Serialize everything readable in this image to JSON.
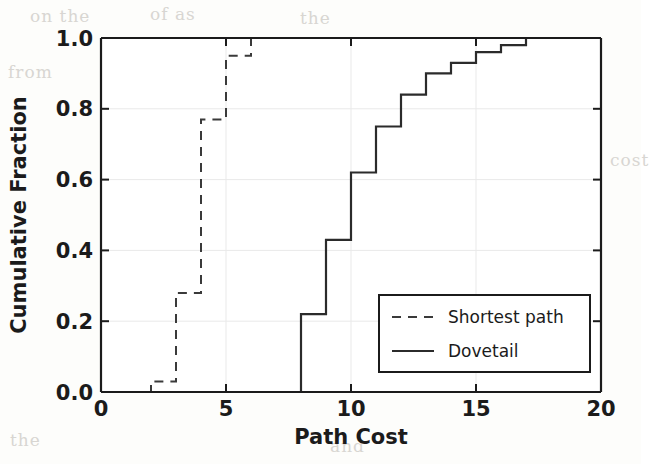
{
  "chart_data": {
    "type": "line",
    "subtype": "step-cdf",
    "title": "",
    "xlabel": "Path Cost",
    "ylabel": "Cumulative Fraction",
    "xlim": [
      0,
      20
    ],
    "ylim": [
      0.0,
      1.0
    ],
    "xticks": [
      0,
      5,
      10,
      15,
      20
    ],
    "xtick_labels": [
      "0",
      "5",
      "10",
      "15",
      "20"
    ],
    "yticks": [
      0.0,
      0.2,
      0.4,
      0.6,
      0.8,
      1.0
    ],
    "ytick_labels": [
      "0.0",
      "0.2",
      "0.4",
      "0.6",
      "0.8",
      "1.0"
    ],
    "grid": true,
    "grid_color": "#e8e8e8",
    "legend_position": "lower right",
    "line_color": "#2b2b2b",
    "series": [
      {
        "name": "Shortest path",
        "style": "dashed",
        "x": [
          0,
          2,
          2,
          3,
          3,
          4,
          4,
          5,
          5,
          6,
          6,
          20
        ],
        "y": [
          0.0,
          0.0,
          0.03,
          0.03,
          0.28,
          0.28,
          0.77,
          0.77,
          0.95,
          0.95,
          1.0,
          1.0
        ],
        "steps": [
          {
            "x": 2,
            "y": 0.03
          },
          {
            "x": 3,
            "y": 0.28
          },
          {
            "x": 4,
            "y": 0.77
          },
          {
            "x": 5,
            "y": 0.95
          },
          {
            "x": 6,
            "y": 1.0
          }
        ]
      },
      {
        "name": "Dovetail",
        "style": "solid",
        "x": [
          0,
          8,
          8,
          9,
          9,
          10,
          10,
          11,
          11,
          12,
          12,
          13,
          13,
          14,
          14,
          15,
          15,
          16,
          16,
          17,
          17,
          20
        ],
        "y": [
          0.0,
          0.0,
          0.22,
          0.22,
          0.43,
          0.43,
          0.62,
          0.62,
          0.75,
          0.75,
          0.84,
          0.84,
          0.9,
          0.9,
          0.93,
          0.93,
          0.96,
          0.96,
          0.98,
          0.98,
          1.0,
          1.0
        ],
        "steps": [
          {
            "x": 8,
            "y": 0.22
          },
          {
            "x": 9,
            "y": 0.43
          },
          {
            "x": 10,
            "y": 0.62
          },
          {
            "x": 11,
            "y": 0.75
          },
          {
            "x": 12,
            "y": 0.84
          },
          {
            "x": 13,
            "y": 0.9
          },
          {
            "x": 14,
            "y": 0.93
          },
          {
            "x": 15,
            "y": 0.96
          },
          {
            "x": 16,
            "y": 0.98
          },
          {
            "x": 17,
            "y": 1.0
          }
        ]
      }
    ]
  },
  "axes": {
    "xlabel": "Path Cost",
    "ylabel": "Cumulative Fraction",
    "xtick_0": "0",
    "xtick_1": "5",
    "xtick_2": "10",
    "xtick_3": "15",
    "xtick_4": "20",
    "ytick_0": "0.0",
    "ytick_1": "0.2",
    "ytick_2": "0.4",
    "ytick_3": "0.6",
    "ytick_4": "0.8",
    "ytick_5": "1.0"
  },
  "legend": {
    "entry_0": "Shortest path",
    "entry_1": "Dovetail"
  },
  "background": {
    "bleed_0": "on the",
    "bleed_1": "of as",
    "bleed_2": "the",
    "bleed_3": "from",
    "bleed_4": "if the",
    "bleed_5": "cost",
    "bleed_6": "the",
    "bleed_7": "and",
    "bleed_8": "of"
  }
}
